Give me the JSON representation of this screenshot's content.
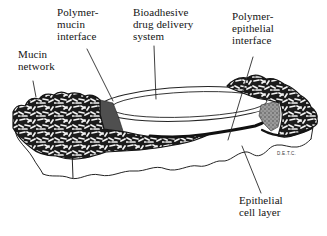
{
  "figure": {
    "ink_color": "#141414",
    "background_color": "#ffffff",
    "polymer_mucin_interface_color": "#4f4f4f",
    "polymer_epithelial_interface_color": "#9b9b9b"
  },
  "labels": {
    "mucin_network": {
      "lines": [
        "Mucin",
        "network"
      ]
    },
    "polymer_mucin": {
      "lines": [
        "Polymer-",
        "mucin",
        "interface"
      ]
    },
    "bioadhesive": {
      "lines": [
        "Bioadhesive",
        "drug delivery",
        "system"
      ]
    },
    "polymer_epithelial": {
      "lines": [
        "Polymer-",
        "epithelial",
        "interface"
      ]
    },
    "epithelial_cell_layer": {
      "lines": [
        "Epithelial",
        "cell layer"
      ]
    },
    "signature": "D.E.T.C."
  }
}
